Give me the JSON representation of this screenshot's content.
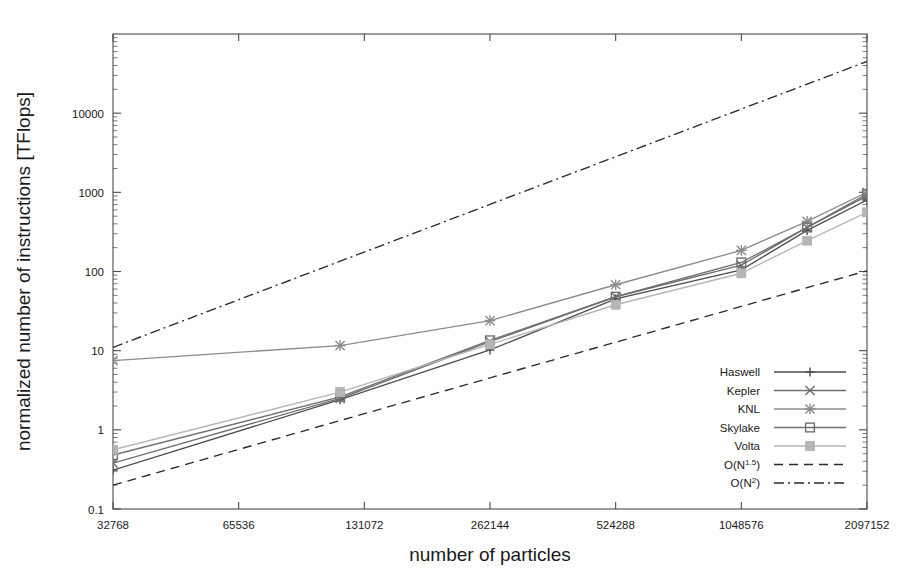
{
  "chart_data": {
    "type": "line",
    "title": "",
    "xlabel": "number of particles",
    "ylabel": "normalized number of instructions [TFlops]",
    "xscale": "log2",
    "yscale": "log10",
    "xlim": [
      32768,
      2097152
    ],
    "ylim": [
      0.1,
      100000
    ],
    "xticks": [
      32768,
      65536,
      131072,
      262144,
      524288,
      1048576,
      2097152
    ],
    "xtick_labels": [
      "32768",
      "65536",
      "131072",
      "262144",
      "524288",
      "1048576",
      "2097152"
    ],
    "yticks": [
      0.1,
      1,
      10,
      100,
      1000,
      10000
    ],
    "ytick_labels": [
      "0.1",
      "1",
      "10",
      "100",
      "1000",
      "10000"
    ],
    "grid": false,
    "legend_position": "bottom-right",
    "x": [
      32768,
      114688,
      262144,
      524288,
      1048576,
      1507328,
      2097152
    ],
    "series": [
      {
        "name": "Haswell",
        "marker": "plus",
        "color": "#4d4d4d",
        "style": "solid",
        "values": [
          0.31,
          2.4,
          10.2,
          45.0,
          105.0,
          330.0,
          800.0
        ]
      },
      {
        "name": "Kepler",
        "marker": "cross",
        "color": "#6e6e6e",
        "style": "solid",
        "values": [
          0.38,
          2.5,
          13.0,
          48.0,
          120.0,
          360.0,
          900.0
        ]
      },
      {
        "name": "KNL",
        "marker": "star",
        "color": "#8c8c8c",
        "style": "solid",
        "values": [
          7.5,
          11.6,
          24.0,
          68.0,
          185.0,
          430.0,
          1000.0
        ]
      },
      {
        "name": "Skylake",
        "marker": "square-open",
        "color": "#707070",
        "style": "solid",
        "values": [
          0.48,
          2.6,
          13.5,
          48.0,
          130.0,
          360.0,
          950.0
        ]
      },
      {
        "name": "Volta",
        "marker": "square-filled",
        "color": "#b5b5b5",
        "style": "solid",
        "values": [
          0.56,
          3.0,
          12.0,
          38.0,
          95.0,
          245.0,
          560.0
        ]
      },
      {
        "name": "O(N^1.5)",
        "marker": "none",
        "color": "#2b2b2b",
        "style": "dashed",
        "values": [
          0.2,
          1.31,
          4.53,
          12.8,
          36.2,
          62.5,
          102.0
        ]
      },
      {
        "name": "O(N^2)",
        "marker": "none",
        "color": "#2b2b2b",
        "style": "dashdot",
        "values": [
          11.0,
          134.8,
          704.0,
          2816.0,
          11264.0,
          23264.0,
          45056.0
        ]
      }
    ],
    "legend": [
      {
        "label": "Haswell",
        "marker": "plus",
        "line": "solid",
        "color": "#4d4d4d"
      },
      {
        "label": "Kepler",
        "marker": "cross",
        "line": "solid",
        "color": "#6e6e6e"
      },
      {
        "label": "KNL",
        "marker": "star",
        "line": "solid",
        "color": "#8c8c8c"
      },
      {
        "label": "Skylake",
        "marker": "square-open",
        "line": "solid",
        "color": "#707070"
      },
      {
        "label": "Volta",
        "marker": "square-filled",
        "line": "solid",
        "color": "#b5b5b5"
      },
      {
        "label": "O(N",
        "label_sup": "1.5",
        "label_tail": ")",
        "marker": "none",
        "line": "dashed",
        "color": "#2b2b2b"
      },
      {
        "label": "O(N",
        "label_sup": "2",
        "label_tail": ")",
        "marker": "none",
        "line": "dashdot",
        "color": "#2b2b2b"
      }
    ]
  },
  "plot_area": {
    "left": 113,
    "right": 867,
    "top": 34,
    "bottom": 509
  }
}
